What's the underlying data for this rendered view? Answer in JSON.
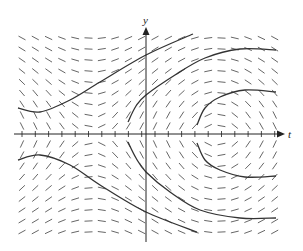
{
  "figure": {
    "type": "slope-field",
    "axes": {
      "x_label": "t",
      "y_label": "y",
      "origin_px": [
        146,
        134
      ],
      "x_axis_px": [
        14,
        285
      ],
      "y_axis_px": [
        242,
        27
      ],
      "tick_spacing_px": 13.3,
      "tick_count_left": 9,
      "tick_count_right": 10
    },
    "grid": {
      "columns": 20,
      "col_start_px": 22,
      "col_spacing_px": 13.3,
      "row_spacing_px": 11,
      "rows_above": 9,
      "rows_below": 9,
      "segment_length_px": 8
    },
    "colors": {
      "axis": "#222222",
      "segment": "#555555",
      "curve": "#333333",
      "background": "#ffffff"
    },
    "solution_curves": [
      {
        "name": "upper-left-curve",
        "points": [
          [
            18,
            108
          ],
          [
            40,
            112
          ],
          [
            70,
            100
          ],
          [
            100,
            82
          ],
          [
            146,
            55
          ],
          [
            193,
            34
          ]
        ]
      },
      {
        "name": "upper-middle-curve",
        "points": [
          [
            128,
            122
          ],
          [
            136,
            106
          ],
          [
            146,
            95
          ],
          [
            175,
            75
          ],
          [
            205,
            58
          ],
          [
            240,
            49
          ],
          [
            276,
            50
          ]
        ]
      },
      {
        "name": "upper-right-curve",
        "points": [
          [
            197,
            125
          ],
          [
            205,
            108
          ],
          [
            220,
            97
          ],
          [
            245,
            90
          ],
          [
            276,
            92
          ]
        ]
      },
      {
        "name": "lower-left-curve",
        "points": [
          [
            18,
            160
          ],
          [
            40,
            155
          ],
          [
            70,
            165
          ],
          [
            100,
            185
          ],
          [
            146,
            212
          ],
          [
            197,
            232
          ]
        ]
      },
      {
        "name": "lower-middle-curve",
        "points": [
          [
            128,
            142
          ],
          [
            136,
            158
          ],
          [
            146,
            172
          ],
          [
            170,
            192
          ],
          [
            200,
            210
          ],
          [
            240,
            218
          ],
          [
            276,
            218
          ]
        ]
      },
      {
        "name": "lower-right-curve",
        "points": [
          [
            197,
            143
          ],
          [
            205,
            160
          ],
          [
            220,
            170
          ],
          [
            245,
            177
          ],
          [
            276,
            176
          ]
        ]
      }
    ]
  }
}
